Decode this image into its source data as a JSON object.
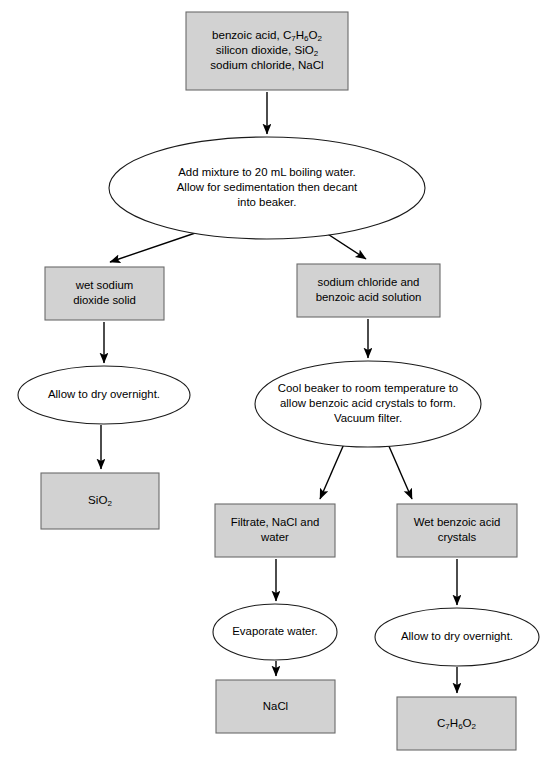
{
  "diagram": {
    "type": "flowchart",
    "orientation": "top-to-bottom",
    "colors": {
      "box_fill": "#d2d2d2",
      "box_stroke": "#6b6b6b",
      "ellipse_fill": "#ffffff",
      "ellipse_stroke": "#1a1a1a",
      "arrow": "#000000",
      "background": "#ffffff",
      "text": "#000000"
    },
    "nodes": [
      {
        "id": "mixture",
        "shape": "rectangle",
        "role": "start-material",
        "x": 186,
        "y": 12,
        "w": 162,
        "h": 78,
        "lines": [
          [
            {
              "t": "benzoic acid, C"
            },
            {
              "t": "7",
              "sub": true
            },
            {
              "t": "H"
            },
            {
              "t": "6",
              "sub": true
            },
            {
              "t": "O"
            },
            {
              "t": "2",
              "sub": true
            }
          ],
          [
            {
              "t": "silicon dioxide, SiO"
            },
            {
              "t": "2",
              "sub": true
            }
          ],
          [
            {
              "t": "sodium chloride, NaCl"
            }
          ]
        ],
        "text": "benzoic acid, C7H6O2 / silicon dioxide, SiO2 / sodium chloride, NaCl"
      },
      {
        "id": "add-mixture",
        "shape": "ellipse",
        "role": "process-step",
        "cx": 267,
        "cy": 188,
        "rx": 158,
        "ry": 51,
        "lines": [
          [
            {
              "t": "Add mixture to 20 mL boiling water."
            }
          ],
          [
            {
              "t": "Allow for sedimentation then decant"
            }
          ],
          [
            {
              "t": "into beaker."
            }
          ]
        ],
        "text": "Add mixture to 20 mL boiling water. Allow for sedimentation then decant into beaker."
      },
      {
        "id": "wet-solid",
        "shape": "rectangle",
        "role": "intermediate",
        "x": 45,
        "y": 267,
        "w": 119,
        "h": 53,
        "lines": [
          [
            {
              "t": "wet sodium"
            }
          ],
          [
            {
              "t": "dioxide solid"
            }
          ]
        ],
        "text": "wet sodium dioxide solid"
      },
      {
        "id": "nacl-benzoic-solution",
        "shape": "rectangle",
        "role": "intermediate",
        "x": 297,
        "y": 264,
        "w": 143,
        "h": 53,
        "lines": [
          [
            {
              "t": "sodium chloride and"
            }
          ],
          [
            {
              "t": "benzoic acid solution"
            }
          ]
        ],
        "text": "sodium chloride and benzoic acid solution"
      },
      {
        "id": "dry-overnight-left",
        "shape": "ellipse",
        "role": "process-step",
        "cx": 104,
        "cy": 395,
        "rx": 86,
        "ry": 29,
        "lines": [
          [
            {
              "t": "Allow to dry overnight."
            }
          ]
        ],
        "text": "Allow to dry overnight."
      },
      {
        "id": "cool-beaker",
        "shape": "ellipse",
        "role": "process-step",
        "cx": 368,
        "cy": 404,
        "rx": 113,
        "ry": 43,
        "lines": [
          [
            {
              "t": "Cool beaker to room temperature to"
            }
          ],
          [
            {
              "t": "allow benzoic acid crystals to form."
            }
          ],
          [
            {
              "t": "Vacuum filter."
            }
          ]
        ],
        "text": "Cool beaker to room temperature to allow benzoic acid crystals to form. Vacuum filter."
      },
      {
        "id": "sio2-product",
        "shape": "rectangle",
        "role": "product",
        "x": 41,
        "y": 473,
        "w": 118,
        "h": 56,
        "lines": [
          [
            {
              "t": "SiO"
            },
            {
              "t": "2",
              "sub": true
            }
          ]
        ],
        "text": "SiO2"
      },
      {
        "id": "filtrate",
        "shape": "rectangle",
        "role": "intermediate",
        "x": 215,
        "y": 504,
        "w": 120,
        "h": 53,
        "lines": [
          [
            {
              "t": "Filtrate, NaCl and"
            }
          ],
          [
            {
              "t": "water"
            }
          ]
        ],
        "text": "Filtrate, NaCl and water"
      },
      {
        "id": "wet-crystals",
        "shape": "rectangle",
        "role": "intermediate",
        "x": 397,
        "y": 504,
        "w": 120,
        "h": 53,
        "lines": [
          [
            {
              "t": "Wet benzoic acid"
            }
          ],
          [
            {
              "t": "crystals"
            }
          ]
        ],
        "text": "Wet benzoic acid crystals"
      },
      {
        "id": "evaporate-water",
        "shape": "ellipse",
        "role": "process-step",
        "cx": 275,
        "cy": 632,
        "rx": 62,
        "ry": 28,
        "lines": [
          [
            {
              "t": "Evaporate water."
            }
          ]
        ],
        "text": "Evaporate water."
      },
      {
        "id": "dry-overnight-right",
        "shape": "ellipse",
        "role": "process-step",
        "cx": 457,
        "cy": 637,
        "rx": 82,
        "ry": 29,
        "lines": [
          [
            {
              "t": "Allow to dry overnight."
            }
          ]
        ],
        "text": "Allow to dry overnight."
      },
      {
        "id": "nacl-product",
        "shape": "rectangle",
        "role": "product",
        "x": 216,
        "y": 680,
        "w": 119,
        "h": 53,
        "lines": [
          [
            {
              "t": "NaCl"
            }
          ]
        ],
        "text": "NaCl"
      },
      {
        "id": "benzoic-product",
        "shape": "rectangle",
        "role": "product",
        "x": 397,
        "y": 697,
        "w": 119,
        "h": 53,
        "lines": [
          [
            {
              "t": "C"
            },
            {
              "t": "7",
              "sub": true
            },
            {
              "t": "H"
            },
            {
              "t": "6",
              "sub": true
            },
            {
              "t": "O"
            },
            {
              "t": "2",
              "sub": true
            }
          ]
        ],
        "text": "C7H6O2"
      }
    ],
    "edges": [
      {
        "id": "e1",
        "from": "mixture",
        "to": "add-mixture",
        "x1": 267,
        "y1": 92,
        "x2": 267,
        "y2": 134
      },
      {
        "id": "e2",
        "from": "add-mixture",
        "to": "wet-solid",
        "x1": 207,
        "y1": 229,
        "x2": 110,
        "y2": 262
      },
      {
        "id": "e3",
        "from": "add-mixture",
        "to": "nacl-benzoic-solution",
        "x1": 320,
        "y1": 229,
        "x2": 366,
        "y2": 259
      },
      {
        "id": "e4",
        "from": "wet-solid",
        "to": "dry-overnight-left",
        "x1": 104,
        "y1": 322,
        "x2": 104,
        "y2": 363
      },
      {
        "id": "e5",
        "from": "nacl-benzoic-solution",
        "to": "cool-beaker",
        "x1": 368,
        "y1": 319,
        "x2": 368,
        "y2": 358
      },
      {
        "id": "e6",
        "from": "dry-overnight-left",
        "to": "sio2-product",
        "x1": 101,
        "y1": 425,
        "x2": 101,
        "y2": 469
      },
      {
        "id": "e7",
        "from": "cool-beaker",
        "to": "filtrate",
        "x1": 344,
        "y1": 444,
        "x2": 320,
        "y2": 499
      },
      {
        "id": "e8",
        "from": "cool-beaker",
        "to": "wet-crystals",
        "x1": 388,
        "y1": 444,
        "x2": 412,
        "y2": 499
      },
      {
        "id": "e9",
        "from": "filtrate",
        "to": "evaporate-water",
        "x1": 276,
        "y1": 559,
        "x2": 276,
        "y2": 601
      },
      {
        "id": "e10",
        "from": "wet-crystals",
        "to": "dry-overnight-right",
        "x1": 457,
        "y1": 559,
        "x2": 457,
        "y2": 605
      },
      {
        "id": "e11",
        "from": "evaporate-water",
        "to": "nacl-product",
        "x1": 276,
        "y1": 661,
        "x2": 276,
        "y2": 676
      },
      {
        "id": "e12",
        "from": "dry-overnight-right",
        "to": "benzoic-product",
        "x1": 457,
        "y1": 667,
        "x2": 457,
        "y2": 693
      }
    ]
  }
}
